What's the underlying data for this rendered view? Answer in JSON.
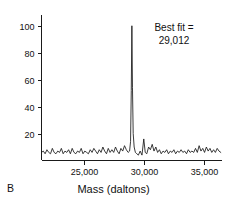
{
  "panel": {
    "letter": "B"
  },
  "annotation": {
    "line1": "Best fit =",
    "line2": "29,012",
    "value": 29012
  },
  "colors": {
    "trace": "#181818",
    "axis": "#1a1a1a",
    "background": "#ffffff",
    "text": "#111111"
  },
  "chart_data": {
    "type": "line",
    "title": "",
    "subtitle": "",
    "xlabel": "Mass (daltons)",
    "ylabel": "",
    "grid": false,
    "legend": null,
    "xlim": [
      21500,
      36500
    ],
    "ylim": [
      0,
      108
    ],
    "xticks": [
      25000,
      30000,
      35000
    ],
    "xtick_labels": [
      "25,000",
      "30,000",
      "35,000"
    ],
    "yticks": [
      20,
      40,
      60,
      80,
      100
    ],
    "ytick_labels": [
      "20",
      "40",
      "60",
      "80",
      "100"
    ],
    "annotations": [
      {
        "text": "Best fit = 29,012",
        "x": 29012,
        "y": 100
      }
    ],
    "series": [
      {
        "name": "relative intensity",
        "x": [
          21500,
          21650,
          21800,
          21950,
          22100,
          22250,
          22400,
          22550,
          22700,
          22850,
          23000,
          23150,
          23300,
          23450,
          23600,
          23750,
          23900,
          24050,
          24200,
          24350,
          24500,
          24650,
          24800,
          24950,
          25100,
          25250,
          25400,
          25550,
          25700,
          25850,
          26000,
          26150,
          26300,
          26450,
          26600,
          26750,
          26900,
          27050,
          27200,
          27350,
          27500,
          27650,
          27800,
          27950,
          28100,
          28250,
          28400,
          28550,
          28700,
          28820,
          28900,
          28960,
          29012,
          29060,
          29120,
          29200,
          29300,
          29420,
          29550,
          29700,
          29850,
          30000,
          30120,
          30250,
          30400,
          30550,
          30700,
          30850,
          31000,
          31150,
          31300,
          31450,
          31600,
          31750,
          31900,
          32050,
          32200,
          32350,
          32500,
          32650,
          32800,
          32950,
          33100,
          33250,
          33400,
          33550,
          33700,
          33850,
          34000,
          34150,
          34300,
          34450,
          34600,
          34750,
          34900,
          35050,
          35200,
          35350,
          35500,
          35650,
          35800,
          35950,
          36100,
          36250,
          36400
        ],
        "y": [
          6,
          7,
          5,
          8,
          6,
          5,
          9,
          6,
          5,
          7,
          6,
          9,
          5,
          7,
          6,
          8,
          5,
          9,
          6,
          5,
          7,
          6,
          9,
          5,
          7,
          6,
          5,
          8,
          6,
          9,
          7,
          5,
          8,
          6,
          10,
          7,
          5,
          9,
          6,
          8,
          6,
          10,
          7,
          5,
          9,
          7,
          11,
          8,
          6,
          7,
          14,
          52,
          100,
          54,
          20,
          10,
          6,
          5,
          4,
          7,
          4,
          16,
          6,
          5,
          10,
          8,
          12,
          7,
          10,
          6,
          8,
          5,
          7,
          6,
          8,
          5,
          7,
          6,
          8,
          5,
          7,
          6,
          8,
          6,
          7,
          5,
          8,
          6,
          7,
          6,
          9,
          6,
          11,
          7,
          9,
          6,
          10,
          7,
          9,
          6,
          8,
          6,
          9,
          7,
          6
        ]
      }
    ]
  }
}
